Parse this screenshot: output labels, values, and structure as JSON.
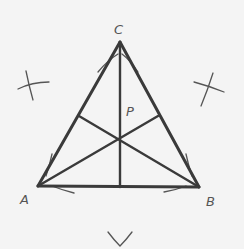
{
  "diagram": {
    "type": "geometry-construction",
    "vertices": {
      "A": {
        "label": "A",
        "x": 38,
        "y": 186
      },
      "B": {
        "label": "B",
        "x": 199,
        "y": 187
      },
      "C": {
        "label": "C",
        "x": 120,
        "y": 42
      }
    },
    "point": {
      "label": "P",
      "x": 120,
      "y": 140
    },
    "labels": {
      "A": "A",
      "B": "B",
      "C": "C",
      "P": "P"
    },
    "colors": {
      "line": "#3a3a3a",
      "label": "#555555",
      "background": "#f4f4f4"
    }
  }
}
